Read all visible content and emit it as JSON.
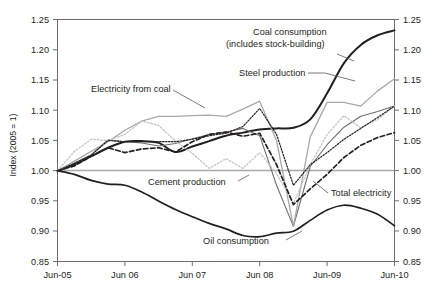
{
  "chart_data": {
    "type": "line",
    "title": "",
    "xlabel": "",
    "ylabel": "Index (2005 = 1)",
    "ylim": [
      0.85,
      1.25
    ],
    "ytick_labels": [
      "1.25",
      "1.20",
      "1.15",
      "1.10",
      "1.05",
      "1.00",
      "0.95",
      "0.90",
      "0.85"
    ],
    "ytick_values": [
      1.25,
      1.2,
      1.15,
      1.1,
      1.05,
      1.0,
      0.95,
      0.9,
      0.85
    ],
    "right_axis": true,
    "right_ytick_labels": [
      "1.25",
      "1.20",
      "1.15",
      "1.10",
      "1.05",
      "1.00",
      "0.95",
      "0.90",
      "0.85"
    ],
    "xtick_labels": [
      "Jun-05",
      "Jun 06",
      "Jun 07",
      "Jun 08",
      "Jun-09",
      "Jun-10"
    ],
    "xtick_values": [
      0,
      12,
      24,
      36,
      48,
      60
    ],
    "grid": false,
    "legend_position": "inline-annotations",
    "reference_line": 1.0,
    "annotations": [
      "Coal consumption (includes stock-building)",
      "Steel production",
      "Electricity from coal",
      "Cement production",
      "Total electricity",
      "Oil consumption"
    ],
    "x": [
      0,
      3,
      6,
      9,
      12,
      15,
      18,
      21,
      24,
      27,
      30,
      33,
      36,
      39,
      42,
      45,
      48,
      51,
      54,
      57,
      60
    ],
    "series": [
      {
        "name": "Coal consumption (includes stock-building)",
        "style": "solid-thick-black",
        "color": "#231f20",
        "values": [
          1.0,
          1.01,
          1.024,
          1.038,
          1.048,
          1.049,
          1.046,
          1.031,
          1.04,
          1.049,
          1.058,
          1.063,
          1.068,
          1.07,
          1.071,
          1.085,
          1.128,
          1.178,
          1.208,
          1.224,
          1.232
        ]
      },
      {
        "name": "Steel production",
        "style": "solid-dark-gray",
        "color": "#6d6e71",
        "values": [
          1.0,
          1.013,
          1.026,
          1.051,
          1.048,
          1.046,
          1.041,
          1.045,
          1.053,
          1.06,
          1.064,
          1.07,
          1.058,
          0.976,
          0.908,
          1.007,
          1.043,
          1.072,
          1.09,
          1.098,
          1.107
        ]
      },
      {
        "name": "Electricity from coal",
        "style": "solid-light-gray",
        "color": "#a7a9ac",
        "values": [
          1.0,
          1.016,
          1.032,
          1.048,
          1.067,
          1.082,
          1.09,
          1.09,
          1.091,
          1.092,
          1.09,
          1.102,
          1.115,
          1.05,
          0.908,
          1.056,
          1.113,
          1.113,
          1.107,
          1.132,
          1.152
        ]
      },
      {
        "name": "Cement production",
        "style": "dotted-light-gray",
        "color": "#bcbec0",
        "values": [
          1.0,
          1.032,
          1.052,
          1.05,
          1.06,
          1.082,
          1.075,
          1.049,
          1.029,
          1.004,
          1.02,
          1.004,
          1.03,
          0.995,
          0.946,
          1.01,
          1.06,
          1.091,
          1.071,
          1.085,
          1.107
        ]
      },
      {
        "name": "Steel production (dotted)",
        "style": "dotted-black",
        "color": "#231f20",
        "values": [
          1.0,
          1.012,
          1.026,
          1.05,
          1.048,
          1.048,
          1.048,
          1.048,
          1.052,
          1.058,
          1.062,
          1.073,
          1.103,
          1.06,
          0.976,
          1.01,
          1.03,
          1.052,
          1.07,
          1.088,
          1.107
        ]
      },
      {
        "name": "Total electricity",
        "style": "dashed-black",
        "color": "#231f20",
        "values": [
          1.0,
          1.008,
          1.024,
          1.038,
          1.03,
          1.036,
          1.038,
          1.031,
          1.048,
          1.06,
          1.064,
          1.057,
          1.062,
          1.01,
          0.944,
          0.97,
          0.994,
          1.022,
          1.042,
          1.055,
          1.063
        ]
      },
      {
        "name": "Oil consumption",
        "style": "solid-black-smooth",
        "color": "#231f20",
        "values": [
          1.0,
          0.994,
          0.984,
          0.978,
          0.976,
          0.965,
          0.95,
          0.936,
          0.924,
          0.913,
          0.904,
          0.893,
          0.891,
          0.897,
          0.9,
          0.918,
          0.935,
          0.943,
          0.938,
          0.928,
          0.909
        ]
      }
    ]
  },
  "axes": {
    "ylabel": "Index (2005 = 1)",
    "left_ticks": [
      "1.25",
      "1.20",
      "1.15",
      "1.10",
      "1.05",
      "1.00",
      "0.95",
      "0.90",
      "0.85"
    ],
    "right_ticks": [
      "1.25",
      "1.20",
      "1.15",
      "1.10",
      "1.05",
      "1.00",
      "0.95",
      "0.90",
      "0.85"
    ],
    "x_ticks": [
      "Jun-05",
      "Jun 06",
      "Jun 07",
      "Jun 08",
      "Jun-09",
      "Jun-10"
    ]
  },
  "labels": {
    "coal_line1": "Coal consumption",
    "coal_line2": "(includes stock-building)",
    "steel": "Steel production",
    "electricity_from_coal": "Electricity from coal",
    "cement": "Cement production",
    "total_electricity": "Total electricity",
    "oil": "Oil consumption"
  }
}
